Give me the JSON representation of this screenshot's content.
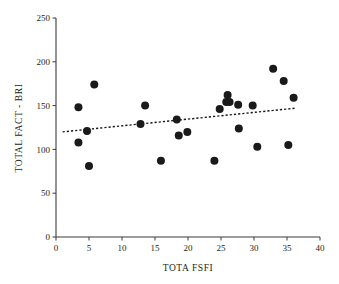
{
  "chart_data": {
    "type": "scatter",
    "title": "",
    "xlabel": "TOTA FSFI",
    "ylabel": "TOTAL FACT - BRI",
    "xlim": [
      0,
      40
    ],
    "ylim": [
      0,
      250
    ],
    "xticks": [
      0,
      5,
      10,
      15,
      20,
      25,
      30,
      35,
      40
    ],
    "yticks": [
      0,
      50,
      100,
      150,
      200,
      250
    ],
    "xtick_labels": [
      "0",
      "5",
      "10",
      "15",
      "20",
      "25",
      "30",
      "35",
      "40"
    ],
    "ytick_labels": [
      "0",
      "50",
      "100",
      "150",
      "200",
      "250"
    ],
    "grid": false,
    "legend": false,
    "point_color": "#1a1a1a",
    "point_size": 4.0,
    "axis_color": "#3b3b3b",
    "points": [
      {
        "x": 3.4,
        "y": 148
      },
      {
        "x": 3.4,
        "y": 108
      },
      {
        "x": 4.7,
        "y": 121
      },
      {
        "x": 5.0,
        "y": 81
      },
      {
        "x": 5.8,
        "y": 174
      },
      {
        "x": 12.8,
        "y": 129
      },
      {
        "x": 13.5,
        "y": 150
      },
      {
        "x": 15.9,
        "y": 87
      },
      {
        "x": 18.3,
        "y": 134
      },
      {
        "x": 18.6,
        "y": 116
      },
      {
        "x": 19.9,
        "y": 120
      },
      {
        "x": 24.0,
        "y": 87
      },
      {
        "x": 24.8,
        "y": 146
      },
      {
        "x": 25.8,
        "y": 154
      },
      {
        "x": 26.3,
        "y": 154
      },
      {
        "x": 26.0,
        "y": 162
      },
      {
        "x": 27.6,
        "y": 151
      },
      {
        "x": 27.7,
        "y": 124
      },
      {
        "x": 29.8,
        "y": 150
      },
      {
        "x": 30.5,
        "y": 103
      },
      {
        "x": 32.9,
        "y": 192
      },
      {
        "x": 34.5,
        "y": 178
      },
      {
        "x": 35.2,
        "y": 105
      },
      {
        "x": 36.0,
        "y": 159
      }
    ],
    "trendline": {
      "style": "dashed",
      "x_start": 1.0,
      "y_start": 120,
      "x_end": 36.2,
      "y_end": 147
    }
  }
}
